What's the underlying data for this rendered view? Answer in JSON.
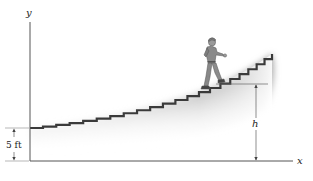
{
  "figure": {
    "type": "physics-diagram",
    "axes": {
      "x_label": "x",
      "y_label": "y"
    },
    "dimensions": {
      "base_height_label": "5 ft",
      "height_label": "h"
    },
    "colors": {
      "axis": "#555555",
      "stair_edge": "#3a3a3a",
      "ground_shade": "#9a9a9a",
      "figure": "#8a8a8a"
    }
  }
}
